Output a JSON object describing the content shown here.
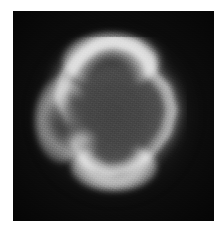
{
  "page": {
    "background_color": "#ffffff",
    "width": 224,
    "height": 236,
    "caption": ""
  },
  "figure": {
    "name": "planetary-nebula-ring",
    "kind": "grayscale-astronomical-image",
    "plate": {
      "left": 13,
      "top": 11,
      "width": 201,
      "height": 210,
      "background_color": "#0c0c0c",
      "border_color": "#0c0c0c"
    },
    "colors": {
      "sky_background": "#0c0c0c",
      "shell_bright": "#e8e8e8",
      "shell_mid": "#b4b4b4",
      "halo_faint": "#6a6a6a",
      "cavity_interior": "#4a4a4a",
      "page_white": "#ffffff"
    },
    "features": [
      {
        "label": "bright shell rim",
        "note": "irregular rounded polygon, brightest at top crown and bottom basin"
      },
      {
        "label": "interior cavity",
        "note": "medium gray, darker than the rim, fills the center of the ring"
      },
      {
        "label": "lower-left notch",
        "note": "inward kink or knot breaking the smooth rim on the lower-left"
      },
      {
        "label": "outer halo",
        "note": "soft diffuse gray glow fading into the black sky"
      },
      {
        "label": "detector grain",
        "note": "visible pixel-scale noise across the whole plate"
      }
    ],
    "shell_outline": {
      "description": "normalized vertices of the bright shell ridge within the plate",
      "points": [
        [
          0.5,
          0.055
        ],
        [
          0.64,
          0.085
        ],
        [
          0.75,
          0.17
        ],
        [
          0.76,
          0.27
        ],
        [
          0.86,
          0.36
        ],
        [
          0.9,
          0.5
        ],
        [
          0.86,
          0.64
        ],
        [
          0.76,
          0.76
        ],
        [
          0.62,
          0.85
        ],
        [
          0.47,
          0.88
        ],
        [
          0.34,
          0.83
        ],
        [
          0.26,
          0.72
        ],
        [
          0.33,
          0.62
        ],
        [
          0.22,
          0.55
        ],
        [
          0.15,
          0.43
        ],
        [
          0.18,
          0.29
        ],
        [
          0.28,
          0.16
        ],
        [
          0.39,
          0.08
        ]
      ]
    }
  }
}
